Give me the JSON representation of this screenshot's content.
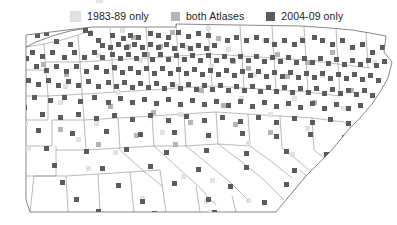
{
  "figure": {
    "kind": "distribution-map",
    "region": "Pennsylvania",
    "background_color": "#ffffff"
  },
  "legend": {
    "position": "top",
    "entries": [
      {
        "label": "1983-89 only",
        "swatch_color": "#e2e2e2",
        "icon": "legend-swatch-icon"
      },
      {
        "label": "both Atlases",
        "swatch_color": "#b4b4b4",
        "icon": "legend-swatch-icon"
      },
      {
        "label": "2004-09 only",
        "swatch_color": "#5c5c5c",
        "icon": "legend-swatch-icon"
      }
    ]
  },
  "map": {
    "outline_color": "#555555",
    "county_border_color": "#6e6e6e",
    "fill_color": "#ffffff",
    "block_size_px": 5,
    "note": "county-level outline map of Pennsylvania with atlas survey blocks"
  },
  "chart_data": {
    "type": "map",
    "title": "",
    "categories": [
      "1983-89 only",
      "both Atlases",
      "2004-09 only"
    ],
    "colors": [
      "#e2e2e2",
      "#b4b4b4",
      "#5c5c5c"
    ],
    "blocks": {
      "1983-89 only": [
        [
          120,
          28
        ],
        [
          206,
          26
        ],
        [
          96,
          53
        ],
        [
          63,
          84
        ],
        [
          174,
          84
        ],
        [
          226,
          47
        ],
        [
          262,
          38
        ],
        [
          300,
          36
        ],
        [
          320,
          73
        ],
        [
          94,
          121
        ],
        [
          23,
          121
        ],
        [
          26,
          146
        ],
        [
          113,
          150
        ],
        [
          181,
          174
        ],
        [
          210,
          178
        ],
        [
          208,
          210
        ],
        [
          246,
          141
        ],
        [
          290,
          152
        ],
        [
          322,
          168
        ],
        [
          363,
          158
        ],
        [
          344,
          147
        ],
        [
          86,
          166
        ],
        [
          140,
          196
        ],
        [
          178,
          112
        ],
        [
          239,
          96
        ],
        [
          268,
          112
        ],
        [
          305,
          126
        ],
        [
          138,
          58
        ],
        [
          209,
          64
        ],
        [
          58,
          100
        ],
        [
          76,
          137
        ],
        [
          160,
          130
        ],
        [
          204,
          199
        ],
        [
          246,
          198
        ],
        [
          292,
          96
        ],
        [
          341,
          106
        ],
        [
          372,
          60
        ],
        [
          116,
          90
        ],
        [
          184,
          45
        ],
        [
          252,
          72
        ]
      ],
      "both Atlases": [
        [
          131,
          35
        ],
        [
          145,
          52
        ],
        [
          158,
          44
        ],
        [
          112,
          66
        ],
        [
          231,
          59
        ],
        [
          246,
          66
        ],
        [
          275,
          52
        ],
        [
          199,
          88
        ],
        [
          221,
          103
        ],
        [
          188,
          120
        ],
        [
          151,
          110
        ],
        [
          108,
          104
        ],
        [
          64,
          72
        ],
        [
          41,
          62
        ],
        [
          305,
          60
        ],
        [
          330,
          50
        ],
        [
          349,
          88
        ],
        [
          312,
          100
        ],
        [
          268,
          130
        ],
        [
          233,
          122
        ],
        [
          173,
          142
        ],
        [
          134,
          133
        ],
        [
          96,
          142
        ],
        [
          58,
          127
        ],
        [
          285,
          74
        ],
        [
          216,
          36
        ],
        [
          170,
          30
        ],
        [
          126,
          44
        ]
      ],
      "2004-09 only": [
        [
          35,
          33
        ],
        [
          44,
          31
        ],
        [
          83,
          28
        ],
        [
          88,
          31
        ],
        [
          54,
          39
        ],
        [
          68,
          42
        ],
        [
          96,
          38
        ],
        [
          110,
          33
        ],
        [
          121,
          36
        ],
        [
          128,
          33
        ],
        [
          136,
          35
        ],
        [
          148,
          31
        ],
        [
          156,
          33
        ],
        [
          166,
          35
        ],
        [
          176,
          30
        ],
        [
          186,
          34
        ],
        [
          196,
          31
        ],
        [
          206,
          33
        ],
        [
          100,
          43
        ],
        [
          108,
          45
        ],
        [
          116,
          42
        ],
        [
          124,
          45
        ],
        [
          132,
          42
        ],
        [
          140,
          45
        ],
        [
          148,
          42
        ],
        [
          156,
          45
        ],
        [
          164,
          42
        ],
        [
          172,
          46
        ],
        [
          180,
          43
        ],
        [
          188,
          46
        ],
        [
          196,
          43
        ],
        [
          204,
          46
        ],
        [
          212,
          43
        ],
        [
          225,
          38
        ],
        [
          234,
          35
        ],
        [
          244,
          38
        ],
        [
          254,
          35
        ],
        [
          264,
          38
        ],
        [
          272,
          42
        ],
        [
          282,
          38
        ],
        [
          292,
          42
        ],
        [
          300,
          38
        ],
        [
          312,
          35
        ],
        [
          320,
          38
        ],
        [
          330,
          42
        ],
        [
          340,
          38
        ],
        [
          350,
          45
        ],
        [
          360,
          42
        ],
        [
          370,
          50
        ],
        [
          380,
          45
        ],
        [
          30,
          50
        ],
        [
          40,
          54
        ],
        [
          50,
          50
        ],
        [
          62,
          55
        ],
        [
          72,
          50
        ],
        [
          82,
          55
        ],
        [
          92,
          50
        ],
        [
          100,
          55
        ],
        [
          110,
          52
        ],
        [
          118,
          56
        ],
        [
          126,
          52
        ],
        [
          134,
          56
        ],
        [
          142,
          52
        ],
        [
          150,
          57
        ],
        [
          158,
          52
        ],
        [
          166,
          57
        ],
        [
          174,
          53
        ],
        [
          182,
          57
        ],
        [
          190,
          53
        ],
        [
          198,
          58
        ],
        [
          206,
          53
        ],
        [
          214,
          58
        ],
        [
          222,
          54
        ],
        [
          230,
          58
        ],
        [
          238,
          54
        ],
        [
          246,
          58
        ],
        [
          254,
          54
        ],
        [
          262,
          59
        ],
        [
          270,
          55
        ],
        [
          278,
          59
        ],
        [
          286,
          55
        ],
        [
          294,
          60
        ],
        [
          302,
          56
        ],
        [
          310,
          60
        ],
        [
          318,
          56
        ],
        [
          326,
          61
        ],
        [
          334,
          57
        ],
        [
          342,
          62
        ],
        [
          350,
          58
        ],
        [
          358,
          62
        ],
        [
          366,
          58
        ],
        [
          374,
          63
        ],
        [
          382,
          59
        ],
        [
          34,
          64
        ],
        [
          44,
          68
        ],
        [
          54,
          64
        ],
        [
          64,
          69
        ],
        [
          74,
          64
        ],
        [
          84,
          69
        ],
        [
          94,
          65
        ],
        [
          104,
          69
        ],
        [
          112,
          65
        ],
        [
          120,
          70
        ],
        [
          128,
          66
        ],
        [
          136,
          70
        ],
        [
          144,
          66
        ],
        [
          152,
          71
        ],
        [
          160,
          66
        ],
        [
          168,
          71
        ],
        [
          176,
          67
        ],
        [
          184,
          71
        ],
        [
          192,
          67
        ],
        [
          200,
          72
        ],
        [
          208,
          68
        ],
        [
          216,
          72
        ],
        [
          224,
          68
        ],
        [
          232,
          73
        ],
        [
          240,
          69
        ],
        [
          248,
          73
        ],
        [
          256,
          69
        ],
        [
          264,
          74
        ],
        [
          272,
          70
        ],
        [
          280,
          74
        ],
        [
          288,
          70
        ],
        [
          296,
          75
        ],
        [
          304,
          71
        ],
        [
          312,
          75
        ],
        [
          320,
          71
        ],
        [
          328,
          76
        ],
        [
          336,
          72
        ],
        [
          344,
          76
        ],
        [
          352,
          72
        ],
        [
          360,
          77
        ],
        [
          368,
          73
        ],
        [
          376,
          78
        ],
        [
          26,
          78
        ],
        [
          36,
          82
        ],
        [
          46,
          78
        ],
        [
          56,
          83
        ],
        [
          66,
          79
        ],
        [
          76,
          83
        ],
        [
          86,
          79
        ],
        [
          96,
          84
        ],
        [
          106,
          80
        ],
        [
          114,
          84
        ],
        [
          122,
          80
        ],
        [
          130,
          85
        ],
        [
          138,
          81
        ],
        [
          146,
          85
        ],
        [
          154,
          81
        ],
        [
          162,
          86
        ],
        [
          170,
          82
        ],
        [
          178,
          86
        ],
        [
          186,
          82
        ],
        [
          194,
          87
        ],
        [
          202,
          83
        ],
        [
          210,
          87
        ],
        [
          218,
          83
        ],
        [
          226,
          88
        ],
        [
          234,
          84
        ],
        [
          242,
          88
        ],
        [
          250,
          84
        ],
        [
          258,
          89
        ],
        [
          266,
          85
        ],
        [
          274,
          89
        ],
        [
          282,
          85
        ],
        [
          290,
          90
        ],
        [
          298,
          86
        ],
        [
          306,
          90
        ],
        [
          314,
          86
        ],
        [
          322,
          91
        ],
        [
          330,
          87
        ],
        [
          338,
          91
        ],
        [
          346,
          88
        ],
        [
          354,
          92
        ],
        [
          362,
          88
        ],
        [
          370,
          93
        ],
        [
          32,
          95
        ],
        [
          48,
          98
        ],
        [
          62,
          95
        ],
        [
          78,
          99
        ],
        [
          92,
          95
        ],
        [
          106,
          100
        ],
        [
          118,
          96
        ],
        [
          130,
          100
        ],
        [
          142,
          97
        ],
        [
          154,
          101
        ],
        [
          166,
          97
        ],
        [
          178,
          102
        ],
        [
          190,
          98
        ],
        [
          202,
          102
        ],
        [
          214,
          99
        ],
        [
          226,
          103
        ],
        [
          238,
          99
        ],
        [
          250,
          104
        ],
        [
          262,
          100
        ],
        [
          274,
          104
        ],
        [
          286,
          101
        ],
        [
          298,
          105
        ],
        [
          310,
          101
        ],
        [
          322,
          106
        ],
        [
          334,
          102
        ],
        [
          346,
          106
        ],
        [
          358,
          103
        ],
        [
          370,
          107
        ],
        [
          40,
          112
        ],
        [
          58,
          115
        ],
        [
          76,
          112
        ],
        [
          94,
          116
        ],
        [
          112,
          113
        ],
        [
          130,
          117
        ],
        [
          148,
          113
        ],
        [
          166,
          118
        ],
        [
          184,
          114
        ],
        [
          202,
          118
        ],
        [
          220,
          115
        ],
        [
          238,
          119
        ],
        [
          256,
          115
        ],
        [
          274,
          120
        ],
        [
          292,
          116
        ],
        [
          310,
          120
        ],
        [
          328,
          117
        ],
        [
          346,
          121
        ],
        [
          364,
          118
        ],
        [
          36,
          128
        ],
        [
          70,
          131
        ],
        [
          104,
          129
        ],
        [
          138,
          132
        ],
        [
          172,
          130
        ],
        [
          206,
          133
        ],
        [
          240,
          131
        ],
        [
          274,
          134
        ],
        [
          308,
          132
        ],
        [
          342,
          135
        ],
        [
          370,
          132
        ],
        [
          44,
          146
        ],
        [
          84,
          149
        ],
        [
          124,
          147
        ],
        [
          164,
          150
        ],
        [
          204,
          148
        ],
        [
          244,
          151
        ],
        [
          284,
          149
        ],
        [
          324,
          152
        ],
        [
          358,
          150
        ],
        [
          52,
          163
        ],
        [
          100,
          166
        ],
        [
          148,
          164
        ],
        [
          196,
          167
        ],
        [
          244,
          165
        ],
        [
          292,
          168
        ],
        [
          340,
          166
        ],
        [
          60,
          180
        ],
        [
          116,
          183
        ],
        [
          172,
          181
        ],
        [
          228,
          184
        ],
        [
          284,
          182
        ],
        [
          336,
          184
        ],
        [
          74,
          197
        ],
        [
          140,
          199
        ],
        [
          206,
          197
        ],
        [
          262,
          200
        ],
        [
          318,
          198
        ],
        [
          152,
          211
        ],
        [
          212,
          210
        ],
        [
          272,
          212
        ],
        [
          96,
          209
        ],
        [
          330,
          205
        ],
        [
          368,
          190
        ],
        [
          384,
          120
        ],
        [
          388,
          140
        ],
        [
          376,
          160
        ],
        [
          358,
          174
        ],
        [
          340,
          190
        ],
        [
          20,
          40
        ],
        [
          24,
          56
        ],
        [
          18,
          90
        ],
        [
          22,
          105
        ],
        [
          16,
          125
        ]
      ]
    },
    "legend_position": "top",
    "xlabel": "",
    "ylabel": ""
  }
}
